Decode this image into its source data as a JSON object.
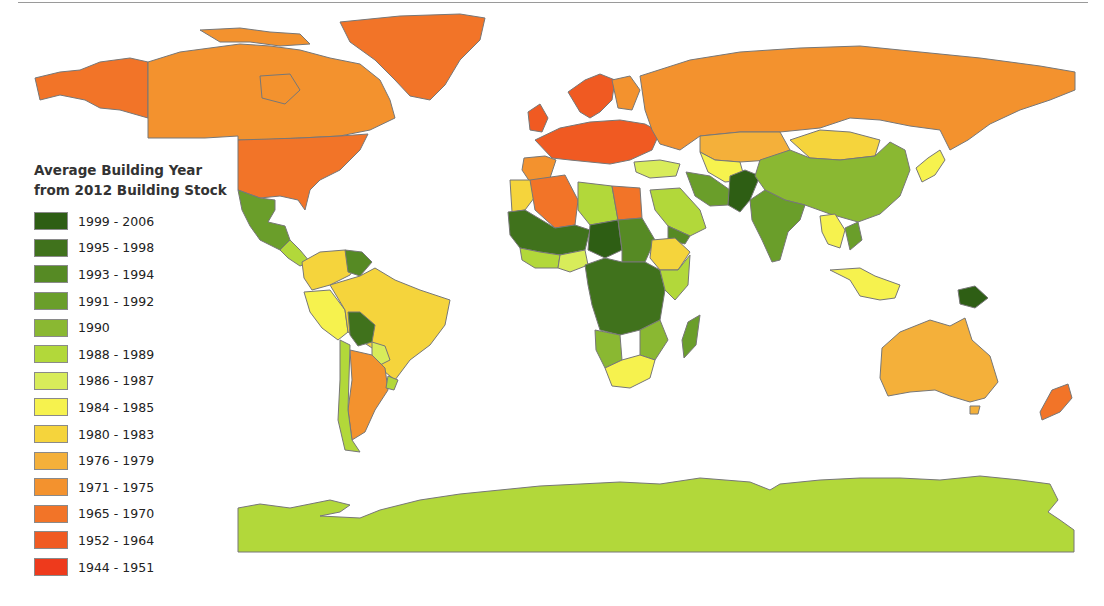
{
  "legend": {
    "title_line1": "Average Building Year",
    "title_line2": "from 2012 Building Stock",
    "items": [
      {
        "label": "1999 - 2006",
        "color": "#2e5e14"
      },
      {
        "label": "1995 - 1998",
        "color": "#40721c"
      },
      {
        "label": "1993 - 1994",
        "color": "#568a24"
      },
      {
        "label": "1991 - 1992",
        "color": "#6a9e2a"
      },
      {
        "label": "1990",
        "color": "#8ab832"
      },
      {
        "label": "1988 - 1989",
        "color": "#b2d83a"
      },
      {
        "label": "1986 - 1987",
        "color": "#d8ec5a"
      },
      {
        "label": "1984 - 1985",
        "color": "#f6f24e"
      },
      {
        "label": "1980 - 1983",
        "color": "#f5d43c"
      },
      {
        "label": "1976 - 1979",
        "color": "#f4b03a"
      },
      {
        "label": "1971 - 1975",
        "color": "#f3922e"
      },
      {
        "label": "1965 - 1970",
        "color": "#f27428"
      },
      {
        "label": "1952 - 1964",
        "color": "#f05a22"
      },
      {
        "label": "1944 - 1951",
        "color": "#ee3a1c"
      }
    ]
  },
  "regions": {
    "north_america_canada": "1971 - 1975",
    "alaska_usa": "1965 - 1970",
    "greenland": "1965 - 1970",
    "mexico_central_america": "1991 - 1992",
    "brazil": "1980 - 1983",
    "argentina": "1971 - 1975",
    "bolivia": "1995 - 1998",
    "western_europe": "1952 - 1964",
    "russia": "1971 - 1975",
    "kazakhstan": "1976 - 1979",
    "mongolia": "1980 - 1983",
    "china": "1988 - 1989",
    "india": "1991 - 1992",
    "afghanistan_pakistan": "1995 - 1998",
    "algeria": "1965 - 1970",
    "egypt": "1965 - 1970",
    "central_africa": "1995 - 1998",
    "southern_africa": "1984 - 1985",
    "ethiopia": "1980 - 1983",
    "madagascar": "1991 - 1992",
    "southeast_asia": "1984 - 1985",
    "australia": "1976 - 1979",
    "new_zealand": "1965 - 1970",
    "antarctica": "1988 - 1989"
  }
}
